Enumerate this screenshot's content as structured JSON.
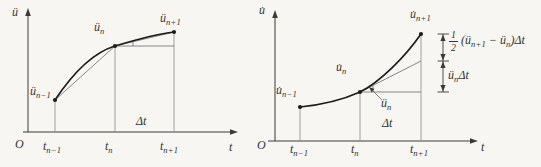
{
  "colors": {
    "bg": "#f7f6f3",
    "curve": "#1c1c1c",
    "thin": "#6a6a6a",
    "axis": "#3a3a3a",
    "text": "#333333"
  },
  "left": {
    "y_axis_label": "ü",
    "x_axis_label": "t",
    "origin_label": "O",
    "point_nm1": {
      "base": "ü",
      "sub": "n−1"
    },
    "point_n": {
      "base": "ü",
      "sub": "n"
    },
    "point_np1": {
      "base": "ü",
      "sub": "n+1"
    },
    "tick_nm1": {
      "base": "t",
      "sub": "n−1"
    },
    "tick_n": {
      "base": "t",
      "sub": "n"
    },
    "tick_np1": {
      "base": "t",
      "sub": "n+1"
    },
    "delta_label": "Δt"
  },
  "right": {
    "y_axis_label": "u̇",
    "x_axis_label": "t",
    "origin_label": "O",
    "point_nm1": {
      "base": "u̇",
      "sub": "n−1"
    },
    "point_n": {
      "base": "u̇",
      "sub": "n"
    },
    "point_np1": {
      "base": "u̇",
      "sub": "n+1"
    },
    "slope_label": {
      "base": "ü",
      "sub": "n"
    },
    "tick_nm1": {
      "base": "t",
      "sub": "n−1"
    },
    "tick_n": {
      "base": "t",
      "sub": "n"
    },
    "tick_np1": {
      "base": "t",
      "sub": "n+1"
    },
    "delta_label": "Δt",
    "dim_upper": {
      "num": "1",
      "den": "2",
      "p1": "(ü",
      "s1": "n+1",
      "p2": " − ü",
      "s2": "n",
      "p3": ")Δt"
    },
    "dim_lower": {
      "p1": "ü",
      "s1": "n",
      "p2": "Δt"
    }
  }
}
